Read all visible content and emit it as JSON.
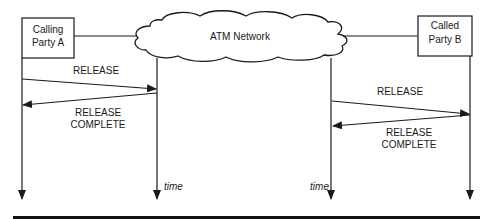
{
  "diagram": {
    "type": "message-sequence",
    "colors": {
      "ink": "#1a1a1a",
      "background": "#ffffff"
    },
    "network": {
      "label": "ATM Network"
    },
    "parties": [
      {
        "id": "A",
        "line1": "Calling",
        "line2": "Party A"
      },
      {
        "id": "B",
        "line1": "Called",
        "line2": "Party B"
      }
    ],
    "messages": [
      {
        "from": "A",
        "to": "network",
        "label_line1": "RELEASE",
        "label_line2": ""
      },
      {
        "from": "network",
        "to": "A",
        "label_line1": "RELEASE",
        "label_line2": "COMPLETE"
      },
      {
        "from": "network",
        "to": "B",
        "label_line1": "RELEASE",
        "label_line2": ""
      },
      {
        "from": "B",
        "to": "network",
        "label_line1": "RELEASE",
        "label_line2": "COMPLETE"
      }
    ],
    "time_labels": [
      "time",
      "time"
    ]
  }
}
